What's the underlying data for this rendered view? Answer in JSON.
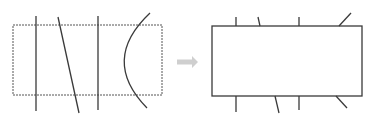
{
  "diagram": {
    "colors": {
      "stroke": "#3a3a3a",
      "dashed_border": "#555555",
      "arrow": "#cfcfcf",
      "background": "#ffffff"
    },
    "left_panel": {
      "rect": {
        "x": 13,
        "y": 25,
        "w": 149,
        "h": 70,
        "style": "dashed"
      },
      "lines": [
        {
          "type": "line",
          "x1": 36,
          "y1": 16,
          "x2": 36,
          "y2": 111
        },
        {
          "type": "line",
          "x1": 58,
          "y1": 17,
          "x2": 79,
          "y2": 113
        },
        {
          "type": "line",
          "x1": 98,
          "y1": 16,
          "x2": 98,
          "y2": 110
        },
        {
          "type": "curve",
          "d": "M150,13 Q100,60 147,108"
        }
      ]
    },
    "arrow": {
      "x1": 177,
      "x2": 198,
      "y": 62
    },
    "right_panel": {
      "rect": {
        "x": 212,
        "y": 26,
        "w": 150,
        "h": 70,
        "style": "solid"
      },
      "stubs": [
        {
          "x1": 236,
          "y1": 17,
          "x2": 236,
          "y2": 26
        },
        {
          "x1": 258,
          "y1": 17,
          "x2": 260,
          "y2": 26
        },
        {
          "x1": 299,
          "y1": 17,
          "x2": 299,
          "y2": 26
        },
        {
          "x1": 351,
          "y1": 13,
          "x2": 339,
          "y2": 26
        },
        {
          "x1": 236,
          "y1": 96,
          "x2": 236,
          "y2": 112
        },
        {
          "x1": 275,
          "y1": 96,
          "x2": 279,
          "y2": 113
        },
        {
          "x1": 299,
          "y1": 96,
          "x2": 299,
          "y2": 110
        },
        {
          "x1": 336,
          "y1": 96,
          "x2": 347,
          "y2": 108
        }
      ]
    }
  }
}
